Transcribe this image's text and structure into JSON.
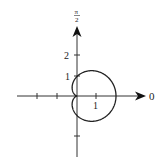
{
  "chart_data": {
    "type": "line",
    "coordinate_system": "polar",
    "title": "",
    "equation": "r = 1 + cos(theta)",
    "curve": "cardioid",
    "axis_labels": {
      "polar_axis": "0",
      "vertical_axis": "π/2"
    },
    "x_ticks": [
      -2,
      -1,
      1
    ],
    "x_tick_labels": [
      "",
      "",
      "1"
    ],
    "y_ticks": [
      2,
      1,
      -1
    ],
    "y_tick_labels": [
      "2",
      "1",
      ""
    ],
    "xlim": [
      -3,
      3.2
    ],
    "ylim": [
      -3.1,
      3.4
    ],
    "grid": false,
    "legend": null,
    "key_points": [
      {
        "theta": "0",
        "r": 2,
        "x": 2,
        "y": 0
      },
      {
        "theta": "π/2",
        "r": 1,
        "x": 0,
        "y": 1
      },
      {
        "theta": "π",
        "r": 0,
        "x": 0,
        "y": 0
      },
      {
        "theta": "3π/2",
        "r": 1,
        "x": 0,
        "y": -1
      }
    ]
  },
  "labels": {
    "zero": "0",
    "pi_num": "π",
    "pi_den": "2",
    "tick_one_x": "1",
    "tick_one_y": "1",
    "tick_two_y": "2"
  }
}
